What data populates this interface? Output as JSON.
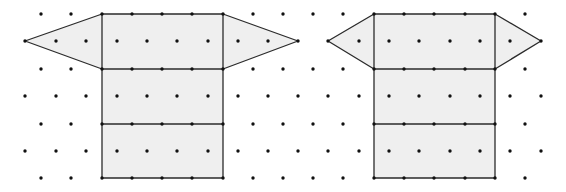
{
  "colors": {
    "background": "#ffffff",
    "fill": "#efefef",
    "line": "#2b2b2b",
    "dot": "#111111"
  },
  "grid": {
    "type": "isometric-dot-grid",
    "row_y": [
      14,
      41,
      69,
      96,
      124,
      151,
      178
    ],
    "even_row_x": [
      41,
      71,
      102,
      132,
      162,
      192,
      223,
      253,
      283,
      313,
      343,
      374,
      404,
      434,
      465,
      495,
      525
    ],
    "odd_row_x": [
      25,
      56,
      86,
      117,
      147,
      177,
      208,
      238,
      268,
      298,
      328,
      359,
      389,
      419,
      450,
      480,
      510,
      541
    ],
    "dot_radius": 1.7
  },
  "figures": [
    {
      "name": "left-net",
      "rectangle": {
        "x1": 102,
        "y1": 14,
        "x2": 223,
        "y2": 178
      },
      "horizontal_dividers_y": [
        69,
        124
      ],
      "left_triangle": [
        [
          102,
          14
        ],
        [
          25,
          41
        ],
        [
          102,
          69
        ]
      ],
      "right_triangle": [
        [
          223,
          14
        ],
        [
          298,
          41
        ],
        [
          223,
          69
        ]
      ]
    },
    {
      "name": "right-net",
      "rectangle": {
        "x1": 374,
        "y1": 14,
        "x2": 495,
        "y2": 178
      },
      "horizontal_dividers_y": [
        69,
        124
      ],
      "left_triangle": [
        [
          374,
          14
        ],
        [
          328,
          41
        ],
        [
          374,
          69
        ]
      ],
      "right_triangle": [
        [
          495,
          14
        ],
        [
          541,
          41
        ],
        [
          495,
          69
        ]
      ]
    }
  ]
}
